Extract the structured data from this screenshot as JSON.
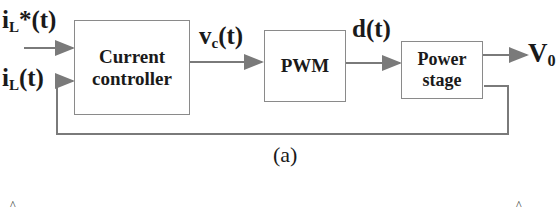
{
  "diagram": {
    "blocks": {
      "current_controller": {
        "line1": "Current",
        "line2": "controller"
      },
      "pwm": {
        "label": "PWM"
      },
      "power_stage": {
        "line1": "Power",
        "line2": "stage"
      }
    },
    "signals": {
      "ref_current": {
        "main": "i",
        "sub": "L",
        "rest": "*(t)"
      },
      "meas_current": {
        "main": "i",
        "sub": "L",
        "rest": "(t)"
      },
      "control_voltage": {
        "main": "v",
        "sub": "c",
        "rest": "(t)"
      },
      "duty": {
        "main": "d(t)"
      },
      "output": {
        "main": "V",
        "sub": "0"
      }
    },
    "caption": "(a)",
    "bottom_marks": {
      "left": "^",
      "right": "^"
    },
    "colors": {
      "wire": "#7a7a7a",
      "box_border": "#8a8a8a",
      "text": "#1a1a1a"
    }
  }
}
